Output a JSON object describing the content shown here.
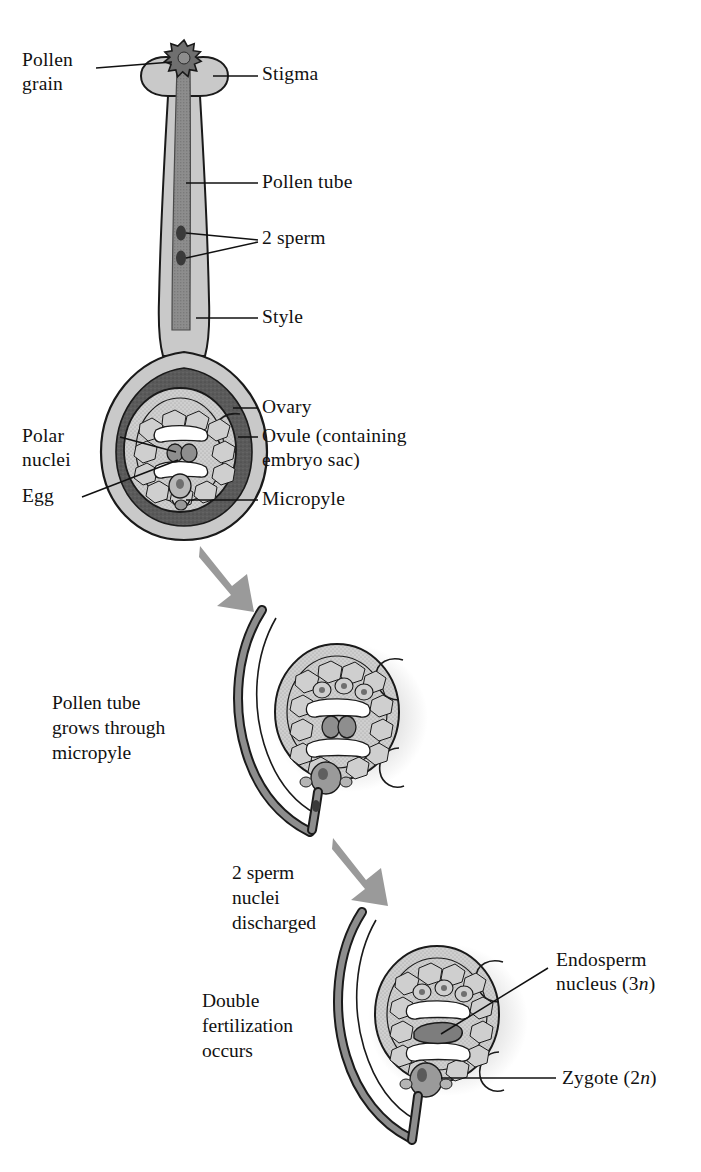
{
  "figure": {
    "background": "#ffffff",
    "ink": "#111111"
  },
  "palette": {
    "outline": "#1a1a1a",
    "wall_light": "#c9c9c9",
    "ovary_dark": "#5b5b5b",
    "ovule_fill": "#d9d9d9",
    "cell_fill": "#cfcfcf",
    "nucleus_fill": "#8e8e8e",
    "tube_fill": "#8d8d8d",
    "arrow_gray": "#9a9a9a",
    "shadow": "#e2e2e2",
    "white": "#ffffff"
  },
  "stage1": {
    "name": "Pollination and pollen tube growth",
    "labels": [
      {
        "key": "pollen_grain",
        "text": "Pollen\ngrain",
        "side": "left"
      },
      {
        "key": "stigma",
        "text": "Stigma",
        "side": "right"
      },
      {
        "key": "pollen_tube",
        "text": "Pollen tube",
        "side": "right"
      },
      {
        "key": "two_sperm",
        "text": "2 sperm",
        "side": "right"
      },
      {
        "key": "style",
        "text": "Style",
        "side": "right"
      },
      {
        "key": "ovary",
        "text": "Ovary",
        "side": "right"
      },
      {
        "key": "ovule",
        "text": "Ovule (containing\nembryo sac)",
        "side": "right"
      },
      {
        "key": "micropyle",
        "text": "Micropyle",
        "side": "right"
      },
      {
        "key": "polar_nuclei",
        "text": "Polar\nnuclei",
        "side": "left"
      },
      {
        "key": "egg",
        "text": "Egg",
        "side": "left"
      }
    ]
  },
  "stage2": {
    "name": "Pollen tube reaches the ovule",
    "caption": "Pollen tube\ngrows through\nmicropyle"
  },
  "stage3": {
    "name": "Sperm nuclei released",
    "caption": "2 sperm\nnuclei\ndischarged"
  },
  "stage4": {
    "name": "Double fertilization",
    "caption": "Double\nfertilization\noccurs",
    "labels": [
      {
        "key": "endosperm_nucleus",
        "text_before": "Endosperm\nnucleus (3",
        "italic": "n",
        "text_after": ")"
      },
      {
        "key": "zygote",
        "text_before": "Zygote (2",
        "italic": "n",
        "text_after": ")"
      }
    ]
  },
  "arrows": [
    {
      "key": "arrow-stage1-to-stage2",
      "label": ""
    },
    {
      "key": "arrow-stage2-to-stage3",
      "label": ""
    }
  ]
}
